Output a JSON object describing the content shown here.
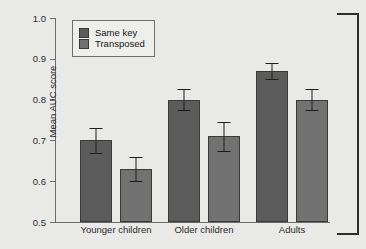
{
  "chart_data": {
    "type": "bar",
    "title": "",
    "xlabel": "",
    "ylabel": "Mean AUC score",
    "ylim": [
      0.5,
      1.0
    ],
    "ytick_values": [
      1.0,
      0.9,
      0.8,
      0.7,
      0.6,
      0.5
    ],
    "ytick_labels": [
      "1.0",
      "0.9",
      "0.8",
      "0.7",
      "0.6",
      "0.5"
    ],
    "grid": false,
    "legend_position": "upper left",
    "categories": [
      "Younger children",
      "Older children",
      "Adults"
    ],
    "series": [
      {
        "name": "Same key",
        "color": "#5c5c5c",
        "values": [
          0.7,
          0.8,
          0.87
        ],
        "errors": [
          0.03,
          0.025,
          0.02
        ]
      },
      {
        "name": "Transposed",
        "color": "#727272",
        "values": [
          0.63,
          0.71,
          0.8
        ],
        "errors": [
          0.03,
          0.035,
          0.025
        ]
      }
    ],
    "annotations": [
      {
        "name": "right-bracket",
        "text": ""
      }
    ]
  },
  "colors": {
    "background": "#e9e9e7",
    "axis": "#6c6c6c",
    "text": "#2b2b2b",
    "bar_edge": "#3a3a3a",
    "error_bar": "#1d1d1d",
    "bracket": "#2e2e2e"
  }
}
